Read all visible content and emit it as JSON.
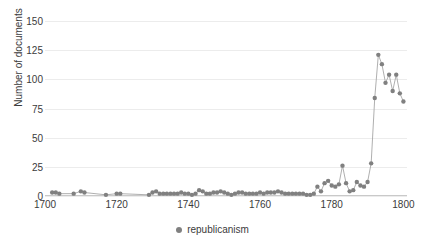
{
  "chart_data": {
    "type": "line",
    "title": "",
    "xlabel": "",
    "ylabel": "Number of documents",
    "xlim": [
      1700,
      1801
    ],
    "ylim": [
      0,
      150
    ],
    "grid": true,
    "legend_position": "bottom",
    "marker": "circle",
    "series_color": "#808080",
    "line_color": "#a6a6a6",
    "x_ticks": [
      "1700",
      "1720",
      "1740",
      "1760",
      "1780",
      "1800"
    ],
    "x_tick_values": [
      1700,
      1720,
      1740,
      1760,
      1780,
      1800
    ],
    "y_ticks": [
      "0",
      "25",
      "50",
      "75",
      "100",
      "125",
      "150"
    ],
    "y_tick_values": [
      0,
      25,
      50,
      75,
      100,
      125,
      150
    ],
    "series": [
      {
        "name": "republicanism",
        "x": [
          1702,
          1703,
          1704,
          1708,
          1710,
          1711,
          1717,
          1720,
          1721,
          1729,
          1730,
          1731,
          1732,
          1733,
          1734,
          1735,
          1736,
          1737,
          1738,
          1739,
          1740,
          1741,
          1742,
          1743,
          1744,
          1745,
          1746,
          1747,
          1748,
          1749,
          1750,
          1751,
          1752,
          1753,
          1754,
          1755,
          1756,
          1757,
          1758,
          1759,
          1760,
          1761,
          1762,
          1763,
          1764,
          1765,
          1766,
          1767,
          1768,
          1769,
          1770,
          1771,
          1772,
          1773,
          1774,
          1775,
          1776,
          1777,
          1778,
          1779,
          1780,
          1781,
          1782,
          1783,
          1784,
          1785,
          1786,
          1787,
          1788,
          1789,
          1790,
          1791,
          1792,
          1793,
          1794,
          1795,
          1796,
          1797,
          1798,
          1799,
          1800
        ],
        "values": [
          3,
          3,
          2,
          2,
          4,
          3,
          1,
          2,
          2,
          1,
          3,
          4,
          2,
          2,
          2,
          2,
          2,
          2,
          3,
          2,
          2,
          1,
          2,
          5,
          4,
          2,
          2,
          3,
          3,
          4,
          3,
          2,
          1,
          2,
          3,
          3,
          2,
          2,
          2,
          2,
          3,
          2,
          3,
          3,
          3,
          4,
          3,
          2,
          2,
          2,
          2,
          2,
          2,
          1,
          1,
          2,
          8,
          4,
          11,
          13,
          9,
          8,
          10,
          26,
          11,
          4,
          5,
          12,
          9,
          8,
          12,
          28,
          84,
          121,
          113,
          97,
          104,
          90,
          104,
          88,
          81
        ]
      }
    ]
  },
  "legend": {
    "label": "republicanism"
  }
}
